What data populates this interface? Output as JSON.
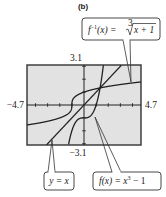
{
  "panel_label": "(b)",
  "chart_data": {
    "type": "line",
    "title": "(b)",
    "xlabel": "",
    "ylabel": "",
    "xlim": [
      -4.7,
      4.7
    ],
    "ylim": [
      -3.1,
      3.1
    ],
    "tick_labels": {
      "x_min": "−4.7",
      "x_max": "4.7",
      "y_max": "3.1",
      "y_min": "−3.1"
    },
    "x_tick_spacing": 1,
    "y_tick_spacing": 1,
    "grid": false,
    "series": [
      {
        "name": "f(x) = x^3 - 1",
        "expression": "x^3 - 1"
      },
      {
        "name": "f^-1(x) = cbrt(x + 1)",
        "expression": "cbrt(x + 1)"
      },
      {
        "name": "y = x",
        "expression": "x"
      }
    ],
    "annotations": [
      "f⁻¹(x) = ∛(x + 1)",
      "y = x",
      "f(x) = x³ − 1"
    ]
  },
  "labels": {
    "inverse": {
      "lhs": "f",
      "sup": "−1",
      "mid": "(x) = ",
      "rad_index": "3",
      "radicand": "x + 1"
    },
    "identity": "y = x",
    "cubic": {
      "lhs": "f(x) = x",
      "sup": "3",
      "rhs": " − 1"
    }
  },
  "colors": {
    "screen_bg": "#e2e2e2",
    "frame": "#333333",
    "curve": "#222222"
  }
}
